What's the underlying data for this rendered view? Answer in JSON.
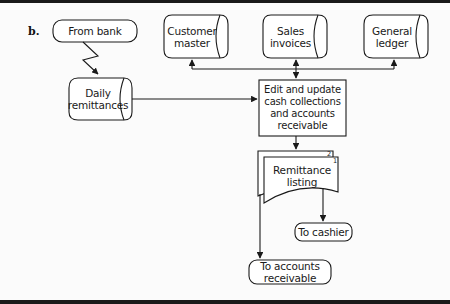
{
  "figure": {
    "part_label": "b.",
    "nodes": {
      "from_bank": {
        "type": "terminal",
        "label": "From bank"
      },
      "customer_master": {
        "type": "disk-file",
        "label": "Customer master"
      },
      "sales_invoices": {
        "type": "disk-file",
        "label": "Sales invoices"
      },
      "general_ledger": {
        "type": "disk-file",
        "label": "General ledger"
      },
      "daily_remittances": {
        "type": "disk-file",
        "label": "Daily remittances"
      },
      "process": {
        "type": "process",
        "label": "Edit and update cash collections and accounts receivable"
      },
      "remittance_listing": {
        "type": "document-multi",
        "label": "Remittance listing",
        "copy_numbers": [
          "2",
          "1"
        ]
      },
      "to_cashier": {
        "type": "terminal",
        "label": "To cashier"
      },
      "to_ar": {
        "type": "terminal",
        "label": "To accounts receivable"
      }
    },
    "edges": [
      {
        "from": "from_bank",
        "to": "daily_remittances",
        "style": "communication-link"
      },
      {
        "from": "daily_remittances",
        "to": "process"
      },
      {
        "from": "process",
        "to": "customer_master",
        "bidirectional_bus": true
      },
      {
        "from": "process",
        "to": "sales_invoices",
        "bidirectional": true
      },
      {
        "from": "process",
        "to": "general_ledger"
      },
      {
        "from": "process",
        "to": "remittance_listing"
      },
      {
        "from": "remittance_listing",
        "to": "to_cashier",
        "copy": "1"
      },
      {
        "from": "remittance_listing",
        "to": "to_ar",
        "copy": "2"
      }
    ]
  }
}
